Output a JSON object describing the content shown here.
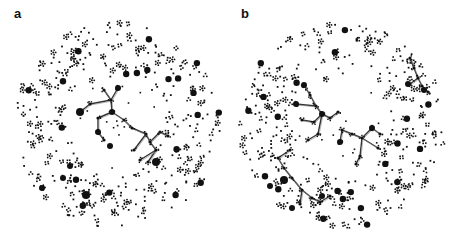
{
  "figure": {
    "panels": [
      {
        "label": "a",
        "center": [
          117,
          125
        ],
        "radius": 103,
        "hole_radius": 48,
        "seed": 11,
        "node_color": "#111111",
        "edge_color": "#333333",
        "main_components": [
          {
            "nodes": [
              [
                118,
                88
              ],
              [
                111,
                100
              ],
              [
                112,
                112
              ],
              [
                98,
                118
              ],
              [
                124,
                120
              ],
              [
                132,
                128
              ],
              [
                146,
                134
              ],
              [
                150,
                142
              ],
              [
                160,
                132
              ],
              [
                168,
                136
              ],
              [
                156,
                150
              ],
              [
                148,
                162
              ],
              [
                140,
                160
              ],
              [
                90,
                104
              ],
              [
                80,
                112
              ],
              [
                98,
                132
              ],
              [
                104,
                140
              ],
              [
                104,
                90
              ],
              [
                134,
                150
              ]
            ],
            "edges": [
              [
                0,
                1
              ],
              [
                1,
                2
              ],
              [
                2,
                3
              ],
              [
                2,
                4
              ],
              [
                4,
                5
              ],
              [
                5,
                6
              ],
              [
                6,
                7
              ],
              [
                7,
                8
              ],
              [
                8,
                9
              ],
              [
                7,
                10
              ],
              [
                10,
                11
              ],
              [
                10,
                12
              ],
              [
                1,
                13
              ],
              [
                13,
                14
              ],
              [
                3,
                15
              ],
              [
                15,
                16
              ],
              [
                1,
                17
              ],
              [
                6,
                18
              ]
            ],
            "hubs": [
              [
                80,
                112,
                4
              ],
              [
                118,
                88,
                3
              ],
              [
                156,
                162,
                4
              ],
              [
                98,
                132,
                3
              ],
              [
                112,
                112,
                3
              ]
            ]
          }
        ],
        "extra_clusters": [
          [
            70,
            166,
            3
          ],
          [
            63,
            178,
            3
          ],
          [
            86,
            195,
            4
          ],
          [
            42,
            188,
            3
          ],
          [
            110,
            146,
            3
          ]
        ]
      },
      {
        "label": "b",
        "center": [
          342,
          125
        ],
        "radius": 103,
        "hole_radius": 48,
        "seed": 29,
        "node_color": "#111111",
        "edge_color": "#333333",
        "main_components": [
          {
            "nodes": [
              [
                304,
                85
              ],
              [
                310,
                95
              ],
              [
                316,
                106
              ],
              [
                322,
                114
              ],
              [
                314,
                122
              ],
              [
                302,
                120
              ],
              [
                296,
                104
              ],
              [
                318,
                134
              ],
              [
                308,
                140
              ],
              [
                330,
                118
              ],
              [
                338,
                112
              ]
            ],
            "edges": [
              [
                0,
                1
              ],
              [
                1,
                2
              ],
              [
                2,
                3
              ],
              [
                3,
                4
              ],
              [
                4,
                5
              ],
              [
                2,
                6
              ],
              [
                3,
                7
              ],
              [
                7,
                8
              ],
              [
                3,
                9
              ],
              [
                9,
                10
              ]
            ],
            "hubs": [
              [
                304,
                85,
                3
              ],
              [
                296,
                104,
                3
              ],
              [
                322,
                114,
                3
              ]
            ]
          },
          {
            "nodes": [
              [
                342,
                130
              ],
              [
                340,
                142
              ],
              [
                352,
                134
              ],
              [
                362,
                138
              ],
              [
                372,
                128
              ],
              [
                380,
                134
              ],
              [
                378,
                148
              ],
              [
                360,
                156
              ],
              [
                356,
                164
              ]
            ],
            "edges": [
              [
                0,
                1
              ],
              [
                0,
                2
              ],
              [
                2,
                3
              ],
              [
                3,
                4
              ],
              [
                4,
                5
              ],
              [
                3,
                6
              ],
              [
                3,
                7
              ],
              [
                7,
                8
              ]
            ],
            "hubs": [
              [
                340,
                142,
                3
              ],
              [
                372,
                128,
                3
              ]
            ]
          },
          {
            "nodes": [
              [
                284,
                168
              ],
              [
                292,
                178
              ],
              [
                302,
                190
              ],
              [
                300,
                204
              ],
              [
                312,
                198
              ],
              [
                320,
                202
              ],
              [
                330,
                196
              ],
              [
                278,
                158
              ],
              [
                290,
                150
              ]
            ],
            "edges": [
              [
                0,
                1
              ],
              [
                1,
                2
              ],
              [
                2,
                3
              ],
              [
                2,
                4
              ],
              [
                4,
                5
              ],
              [
                5,
                6
              ],
              [
                0,
                7
              ],
              [
                7,
                8
              ]
            ],
            "hubs": [
              [
                284,
                180,
                4
              ],
              [
                322,
                196,
                3
              ]
            ]
          },
          {
            "nodes": [
              [
                410,
                58
              ],
              [
                414,
                68
              ],
              [
                418,
                78
              ],
              [
                410,
                84
              ],
              [
                422,
                86
              ],
              [
                428,
                92
              ]
            ],
            "edges": [
              [
                0,
                1
              ],
              [
                1,
                2
              ],
              [
                2,
                3
              ],
              [
                2,
                4
              ],
              [
                4,
                5
              ]
            ],
            "hubs": [
              [
                408,
                84,
                3
              ],
              [
                424,
                90,
                3
              ]
            ]
          }
        ],
        "extra_clusters": [
          [
            270,
            186,
            3
          ],
          [
            292,
            208,
            3
          ]
        ]
      }
    ]
  }
}
